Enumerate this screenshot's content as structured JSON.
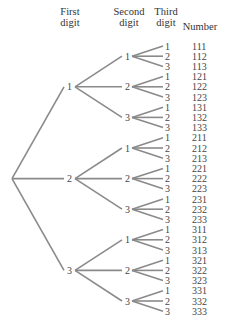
{
  "headers": {
    "first": [
      "First",
      "digit"
    ],
    "second": [
      "Second",
      "digit"
    ],
    "third": [
      "Third",
      "digit"
    ],
    "number": "Number"
  },
  "digits": [
    "1",
    "2",
    "3"
  ],
  "numbers": [
    "111",
    "112",
    "113",
    "121",
    "122",
    "123",
    "131",
    "132",
    "133",
    "211",
    "212",
    "213",
    "221",
    "222",
    "223",
    "231",
    "232",
    "233",
    "311",
    "312",
    "313",
    "321",
    "322",
    "323",
    "331",
    "332",
    "333"
  ],
  "caption": "",
  "colors": {
    "edge": "#8a8a8a",
    "text": "#444444"
  }
}
